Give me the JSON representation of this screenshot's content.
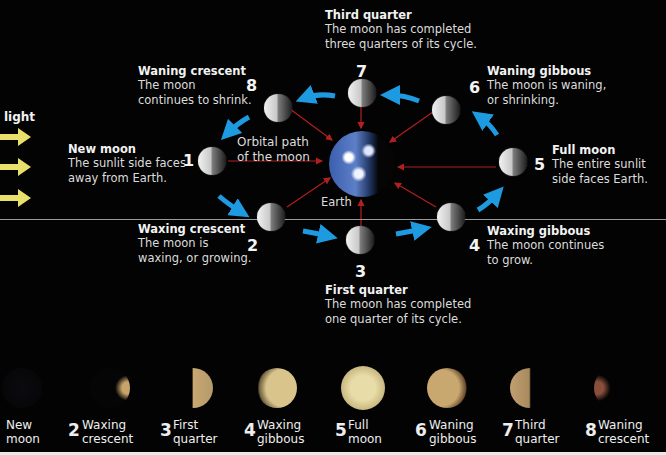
{
  "diagram": {
    "light_label": "light",
    "orbit_label": "Orbital path of the moon",
    "orbit_label_lines": [
      "Orbital path",
      "of the moon"
    ],
    "earth_label": "Earth",
    "colors": {
      "background": "#030303",
      "orbit_arrows": "#1e9be0",
      "sunlight_arrows": "#e8e06a",
      "earth_rays": "#b02020",
      "divider": "#9a9a9a"
    },
    "phases": [
      {
        "num": "1",
        "title": "New moon",
        "desc": [
          "The sunlit side faces",
          "away from Earth."
        ]
      },
      {
        "num": "2",
        "title": "Waxing crescent",
        "desc": [
          "The moon is",
          "waxing, or growing."
        ]
      },
      {
        "num": "3",
        "title": "First quarter",
        "desc": [
          "The moon has completed",
          "one quarter of its cycle."
        ]
      },
      {
        "num": "4",
        "title": "Waxing gibbous",
        "desc": [
          "The moon continues",
          "to grow."
        ]
      },
      {
        "num": "5",
        "title": "Full moon",
        "desc": [
          "The entire sunlit",
          "side faces Earth."
        ]
      },
      {
        "num": "6",
        "title": "Waning gibbous",
        "desc": [
          "The moon is waning,",
          "or shrinking."
        ]
      },
      {
        "num": "7",
        "title": "Third quarter",
        "desc": [
          "The moon has completed",
          "three quarters of its cycle."
        ]
      },
      {
        "num": "8",
        "title": "Waning crescent",
        "desc": [
          "The moon",
          "continues to shrink."
        ]
      }
    ]
  },
  "photo_strip": [
    {
      "num": "",
      "label": [
        "New",
        "moon"
      ]
    },
    {
      "num": "2",
      "label": [
        "Waxing",
        "crescent"
      ]
    },
    {
      "num": "3",
      "label": [
        "First",
        "quarter"
      ]
    },
    {
      "num": "4",
      "label": [
        "Waxing",
        "gibbous"
      ]
    },
    {
      "num": "5",
      "label": [
        "Full",
        "moon"
      ]
    },
    {
      "num": "6",
      "label": [
        "Waning",
        "gibbous"
      ]
    },
    {
      "num": "7",
      "label": [
        "Third",
        "quarter"
      ]
    },
    {
      "num": "8",
      "label": [
        "Waning",
        "crescent"
      ]
    }
  ]
}
